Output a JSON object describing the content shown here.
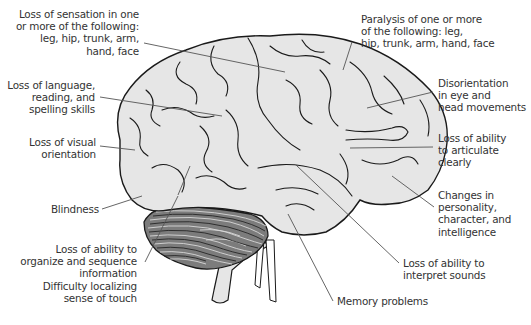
{
  "diagram": {
    "colors": {
      "cerebrum_fill": "#e6e6e6",
      "cerebellum_fill": "#7c7c7c",
      "outline": "#1a1a1a",
      "leader_line": "#555555",
      "text": "#333333"
    },
    "labels_left": [
      {
        "id": "sensation",
        "lines": [
          "Loss of sensation in one",
          "or more of the following:",
          "leg, hip, trunk, arm,",
          "hand, face"
        ]
      },
      {
        "id": "language",
        "lines": [
          "Loss of language,",
          "reading, and",
          "spelling skills"
        ]
      },
      {
        "id": "visual",
        "lines": [
          "Loss of visual",
          "orientation"
        ]
      },
      {
        "id": "blindness",
        "lines": [
          "Blindness"
        ]
      },
      {
        "id": "organize",
        "lines": [
          "Loss of ability to",
          "organize and sequence",
          "information",
          "Difficulty localizing",
          "sense of touch"
        ]
      }
    ],
    "labels_right": [
      {
        "id": "paralysis",
        "lines": [
          "Paralysis of one or more",
          "of the following: leg,",
          "hip, trunk, arm, hand, face"
        ]
      },
      {
        "id": "disorientation",
        "lines": [
          "Disorientation",
          "in eye and",
          "head movements"
        ]
      },
      {
        "id": "articulate",
        "lines": [
          "Loss of ability",
          "to articulate",
          "clearly"
        ]
      },
      {
        "id": "personality",
        "lines": [
          "Changes in",
          "personality,",
          "character, and",
          "intelligence"
        ]
      },
      {
        "id": "sounds",
        "lines": [
          "Loss of ability to",
          "interpret sounds"
        ]
      },
      {
        "id": "memory",
        "lines": [
          "Memory problems"
        ]
      }
    ]
  }
}
